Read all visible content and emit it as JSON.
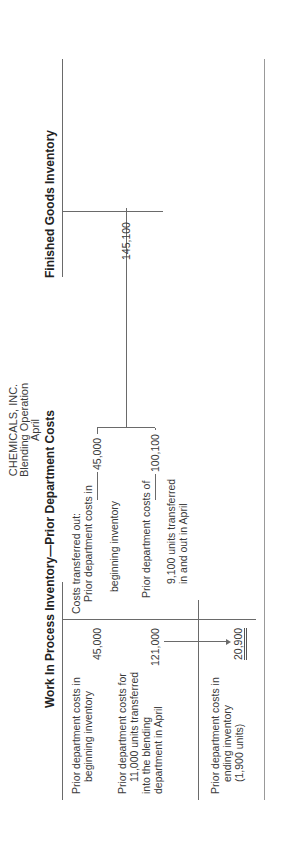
{
  "title": {
    "company": "CHEMICALS, INC.",
    "department": "Blending Operation",
    "period": "April"
  },
  "accounts": {
    "wip": {
      "header": "Work In Process Inventory—Prior Department Costs",
      "debits": [
        {
          "label": [
            "Prior department costs in",
            "beginning inventory"
          ],
          "amount": "45,000"
        },
        {
          "label": [
            "Prior department costs for",
            "11,000 units transferred",
            "into the blending",
            "department in April"
          ],
          "amount": "121,000"
        }
      ],
      "credits": {
        "intro": "Costs transferred out:",
        "items": [
          {
            "label": [
              "Prior department costs in",
              "beginning inventory"
            ],
            "amount": "45,000"
          },
          {
            "label": [
              "Prior department costs of",
              "9,100 units transferred",
              "in and out in April"
            ],
            "amount": "100,100"
          }
        ]
      },
      "ending": {
        "label": [
          "Prior department costs in",
          "ending inventory",
          "(1,900 units)"
        ],
        "amount": "20,900"
      }
    },
    "finished_goods": {
      "header": "Finished Goods Inventory",
      "debit_amount": "145,100"
    }
  }
}
